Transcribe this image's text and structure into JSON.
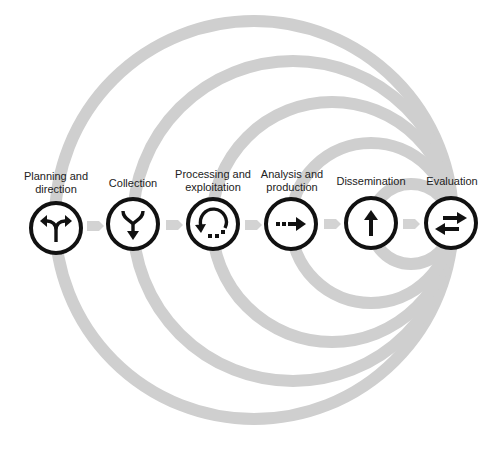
{
  "diagram": {
    "title": "",
    "colors": {
      "arc": "#cfcfcf",
      "connector": "#d3d3d3",
      "ring": "#111111",
      "text": "#222222",
      "background": "#ffffff"
    },
    "stages": [
      {
        "id": "planning",
        "label_lines": [
          "Planning and",
          "direction"
        ],
        "icon": "fork-split-arrows-icon"
      },
      {
        "id": "collection",
        "label_lines": [
          "Collection"
        ],
        "icon": "merge-down-arrow-icon"
      },
      {
        "id": "processing",
        "label_lines": [
          "Processing and",
          "exploitation"
        ],
        "icon": "circular-arrow-dotted-icon"
      },
      {
        "id": "analysis",
        "label_lines": [
          "Analysis and",
          "production"
        ],
        "icon": "dotted-right-arrow-icon"
      },
      {
        "id": "dissemination",
        "label_lines": [
          "Dissemination"
        ],
        "icon": "up-arrow-icon"
      },
      {
        "id": "evaluation",
        "label_lines": [
          "Evaluation"
        ],
        "icon": "exchange-arrows-icon"
      }
    ],
    "connectors": [
      {
        "from": "planning",
        "to": "collection"
      },
      {
        "from": "collection",
        "to": "processing"
      },
      {
        "from": "processing",
        "to": "analysis"
      },
      {
        "from": "analysis",
        "to": "dissemination"
      },
      {
        "from": "dissemination",
        "to": "evaluation"
      }
    ],
    "feedback_loops": [
      {
        "from": "evaluation",
        "to": "planning"
      },
      {
        "from": "evaluation",
        "to": "collection"
      },
      {
        "from": "evaluation",
        "to": "processing"
      },
      {
        "from": "evaluation",
        "to": "analysis"
      },
      {
        "from": "evaluation",
        "to": "dissemination"
      }
    ]
  }
}
